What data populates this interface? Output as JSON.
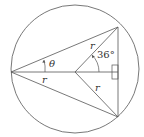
{
  "diagram": {
    "circle": {
      "cx": 75,
      "cy": 69,
      "r": 64
    },
    "points": {
      "left": [
        11,
        72
      ],
      "center": [
        75,
        72
      ],
      "top_right": [
        118,
        27
      ],
      "bottom_right": [
        118,
        117
      ]
    },
    "labels": {
      "theta": "θ",
      "angle_36": "36°",
      "r_top": "r",
      "r_mid": "r",
      "r_bottom": "r"
    },
    "stroke_color": "#555555"
  }
}
